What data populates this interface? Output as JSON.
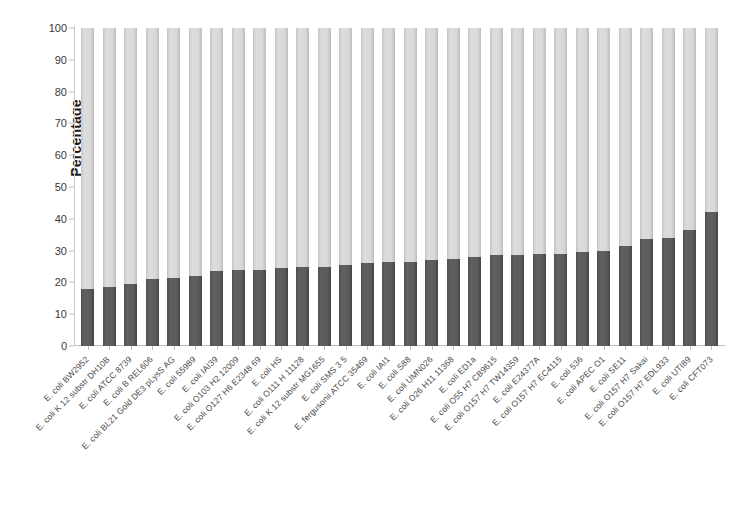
{
  "chart_data": {
    "type": "bar",
    "subtype": "stacked-bar-100-percent",
    "title": "",
    "xlabel": "",
    "ylabel": "Percentage",
    "ylim": [
      0,
      100
    ],
    "yticks": [
      0,
      10,
      20,
      30,
      40,
      50,
      60,
      70,
      80,
      90,
      100
    ],
    "grid": false,
    "legend": "none",
    "colors": {
      "lower_segment": "#595959",
      "upper_segment": "#d4d4d4",
      "axis": "#bfbfbf",
      "text": "#3a3a3a"
    },
    "categories": [
      "E. coli BW2952",
      "E. coli K 12 substr DH10B",
      "E. coli ATCC 8739",
      "E. coli B REL606",
      "E. coli BL21 Gold DE3 pLysS AG",
      "E. coli 55989",
      "E. coli IAI39",
      "E. coli O103 H2 12009",
      "E. coli O127 H6 E2348 69",
      "E. coli HS",
      "E. coli O111 H 11128",
      "E. coli K 12 substr MG1655",
      "E. coli SMS 3 5",
      "E. fergusonii ATCC 35469",
      "E. coli IAI1",
      "E. coli S88",
      "E. coli UMN026",
      "E. coli O26 H11 11368",
      "E. coli ED1a",
      "E. coli O55 H7 CB9615",
      "E. coli O157 H7 TW14359",
      "E. coli E24377A",
      "E. coli O157 H7 EC4115",
      "E. coli 536",
      "E. coli APEC O1",
      "E. coli SE11",
      "E. coli O157 H7 Sakai",
      "E. coli O157 H7 EDL933",
      "E. coli UTI89",
      "E. coli CFT073"
    ],
    "series": [
      {
        "name": "lower-segment",
        "values": [
          18,
          18.5,
          19.5,
          21,
          21.5,
          22,
          23.5,
          24,
          24,
          24.5,
          25,
          25,
          25.5,
          26,
          26.5,
          26.5,
          27,
          27.5,
          28,
          28.5,
          28.5,
          29,
          29,
          29.5,
          30,
          31.5,
          33.5,
          34,
          36.5,
          42
        ]
      },
      {
        "name": "upper-segment",
        "values": [
          82,
          81.5,
          80.5,
          79,
          78.5,
          78,
          76.5,
          76,
          76,
          75.5,
          75,
          75,
          74.5,
          74,
          73.5,
          73.5,
          73,
          72.5,
          72,
          71.5,
          71.5,
          71,
          71,
          70.5,
          70,
          68.5,
          66.5,
          66,
          63.5,
          58
        ]
      }
    ]
  }
}
